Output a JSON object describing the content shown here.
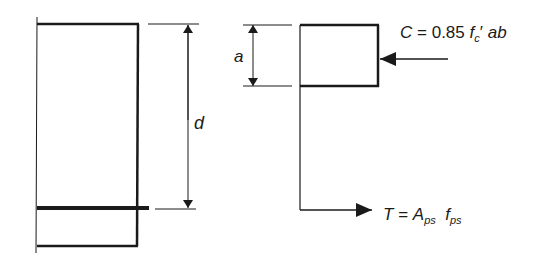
{
  "diagram": {
    "beam_section": {
      "name": "beam cross-section with prestressing tendon"
    },
    "dimensions": {
      "d_label": "d",
      "a_label": "a"
    },
    "forces": {
      "compression": {
        "symbol": "C",
        "equals": "=",
        "coefficient": "0.85",
        "f": "f",
        "f_sub": "c",
        "prime": "′",
        "ab": "ab"
      },
      "tension": {
        "symbol": "T",
        "equals": "=",
        "A": "A",
        "A_sub": "ps",
        "f": "f",
        "f_sub": "ps"
      }
    },
    "colors": {
      "line": "#1a1a1a",
      "background": "#ffffff"
    }
  }
}
